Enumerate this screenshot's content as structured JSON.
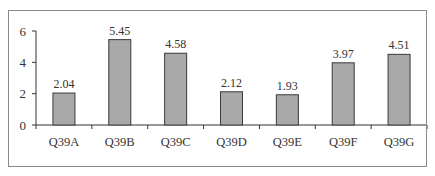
{
  "chart_data": {
    "type": "bar",
    "title": "",
    "xlabel": "",
    "ylabel": "",
    "categories": [
      "Q39A",
      "Q39B",
      "Q39C",
      "Q39D",
      "Q39E",
      "Q39F",
      "Q39G"
    ],
    "values": [
      2.04,
      5.45,
      4.58,
      2.12,
      1.93,
      3.97,
      4.51
    ],
    "data_labels": [
      "2.04",
      "5.45",
      "4.58",
      "2.12",
      "1.93",
      "3.97",
      "4.51"
    ],
    "ylim": [
      0,
      6
    ],
    "yticks": [
      0,
      2,
      4,
      6
    ],
    "ytick_labels": [
      "0",
      "2",
      "4",
      "6"
    ],
    "grid": false,
    "legend": null,
    "colors": {
      "bar_fill": "#a9a9a9",
      "bar_stroke": "#3a3a3a",
      "axis": "#333333",
      "frame": "#8a8a8a"
    }
  }
}
